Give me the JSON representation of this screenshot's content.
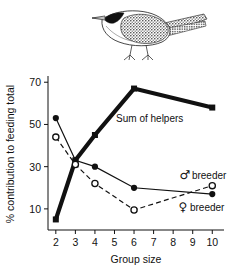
{
  "figure": {
    "illustration": "bird-line-drawing",
    "illustration_caption": ""
  },
  "chart_data": {
    "type": "line",
    "title": "",
    "xlabel": "Group size",
    "ylabel": "% contribution to feeding total",
    "xlim": [
      1.6,
      10.6
    ],
    "ylim": [
      0,
      72
    ],
    "xticks": [
      2,
      3,
      4,
      5,
      6,
      7,
      8,
      9,
      10
    ],
    "xticklabels": [
      "2",
      "3",
      "4",
      "5",
      "6",
      "7",
      "8",
      "9",
      "10"
    ],
    "yticks": [
      10,
      30,
      50,
      70
    ],
    "yticklabels": [
      "10",
      "30",
      "50",
      "70"
    ],
    "grid": false,
    "legend_position": "inline-annotations",
    "series": [
      {
        "name": "Sum of helpers",
        "label": "Sum of helpers",
        "marker": "filled-square",
        "line": "thick-solid",
        "color": "#111111",
        "x": [
          2,
          3,
          4,
          6,
          10
        ],
        "values": [
          5,
          33,
          45,
          67,
          58
        ]
      },
      {
        "name": "male breeder",
        "label": "breeder",
        "symbol": "♂",
        "marker": "filled-circle",
        "line": "thin-solid",
        "color": "#111111",
        "x": [
          2,
          3,
          4,
          6,
          10
        ],
        "values": [
          53,
          33,
          30,
          20,
          17
        ]
      },
      {
        "name": "female breeder",
        "label": "breeder",
        "symbol": "♀",
        "marker": "open-circle",
        "line": "dashed",
        "color": "#111111",
        "x": [
          2,
          3,
          4,
          6,
          10
        ],
        "values": [
          44,
          31,
          22,
          9.5,
          21
        ]
      }
    ],
    "annotations": [
      {
        "text": "Sum of helpers",
        "x": 6.8,
        "y": 53
      },
      {
        "text": "breeder",
        "symbol": "♂",
        "x": 8.6,
        "y": 26
      },
      {
        "text": "breeder",
        "symbol": "♀",
        "x": 8.5,
        "y": 11
      }
    ]
  }
}
